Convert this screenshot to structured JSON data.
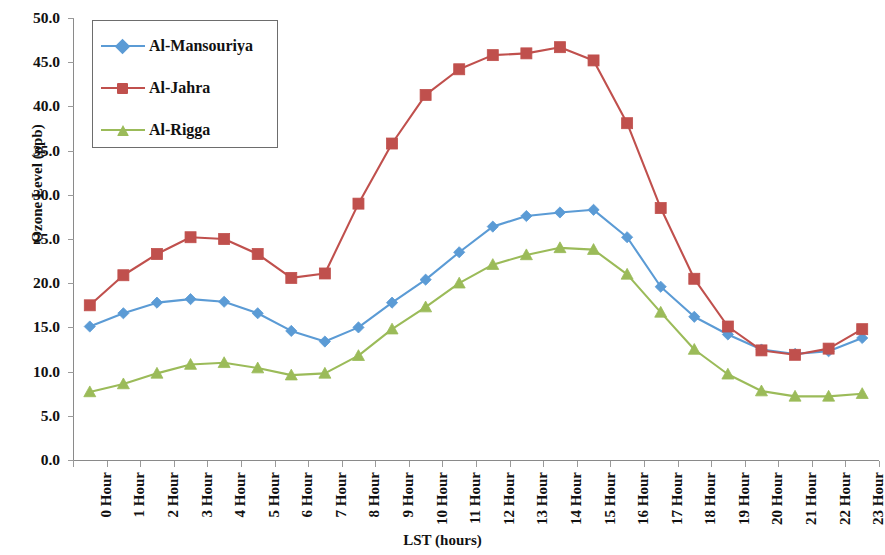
{
  "chart_data": {
    "type": "line",
    "title": "",
    "xlabel": "LST (hours)",
    "ylabel": "Ozone Level (ppb)",
    "ylim": [
      0.0,
      50.0
    ],
    "ytick_step": 5.0,
    "grid": false,
    "legend_position": "top-left-inside",
    "categories": [
      "0 Hour",
      "1 Hour",
      "2 Hour",
      "3 Hour",
      "4 Hour",
      "5 Hour",
      "6 Hour",
      "7 Hour",
      "8 Hour",
      "9 Hour",
      "10 Hour",
      "11 Hour",
      "12 Hour",
      "13 Hour",
      "14 Hour",
      "15 Hour",
      "16 Hour",
      "17 Hour",
      "18 Hour",
      "19 Hour",
      "20 Hour",
      "21 Hour",
      "22 Hour",
      "23 Hour"
    ],
    "ytick_labels": [
      "0.0",
      "5.0",
      "10.0",
      "15.0",
      "20.0",
      "25.0",
      "30.0",
      "35.0",
      "40.0",
      "45.0",
      "50.0"
    ],
    "ytick_values": [
      0.0,
      5.0,
      10.0,
      15.0,
      20.0,
      25.0,
      30.0,
      35.0,
      40.0,
      45.0,
      50.0
    ],
    "series": [
      {
        "name": "Al-Mansouriya",
        "color": "#5B9BD5",
        "marker": "diamond",
        "values": [
          15.1,
          16.6,
          17.8,
          18.2,
          17.9,
          16.6,
          14.6,
          13.4,
          15.0,
          17.8,
          20.4,
          23.5,
          26.4,
          27.6,
          28.0,
          28.3,
          25.2,
          19.6,
          16.2,
          14.2,
          12.5,
          12.0,
          12.3,
          13.8
        ]
      },
      {
        "name": "Al-Jahra",
        "color": "#C0504D",
        "marker": "square",
        "values": [
          17.5,
          20.9,
          23.3,
          25.2,
          25.0,
          23.3,
          20.6,
          21.1,
          29.0,
          35.8,
          41.3,
          44.2,
          45.8,
          46.0,
          46.7,
          45.2,
          38.1,
          28.5,
          20.5,
          15.1,
          12.4,
          11.9,
          12.6,
          14.8
        ]
      },
      {
        "name": "Al-Rigga",
        "color": "#9BBB59",
        "marker": "triangle",
        "values": [
          7.7,
          8.6,
          9.8,
          10.8,
          11.0,
          10.4,
          9.6,
          9.8,
          11.8,
          14.8,
          17.3,
          20.0,
          22.1,
          23.2,
          24.0,
          23.8,
          21.0,
          16.7,
          12.5,
          9.7,
          7.8,
          7.2,
          7.2,
          7.5
        ]
      }
    ]
  },
  "legend": {
    "items": [
      {
        "label": "Al-Mansouriya"
      },
      {
        "label": "Al-Jahra"
      },
      {
        "label": "Al-Rigga"
      }
    ]
  },
  "axes": {
    "y_title": "Ozone Level (ppb)",
    "x_title": "LST (hours)"
  }
}
